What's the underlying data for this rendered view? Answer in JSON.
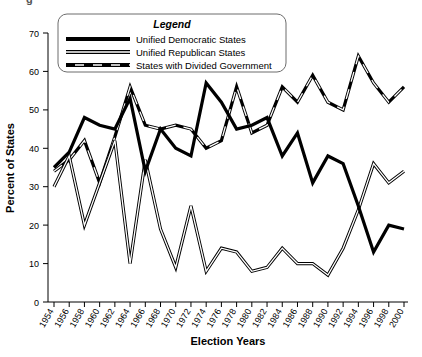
{
  "figure": {
    "caption_stub": "g",
    "xlabel": "Election Years",
    "ylabel": "Percent of States"
  },
  "legend": {
    "title": "Legend",
    "items": [
      {
        "label": "Unified Democratic States",
        "style": "solid-thick",
        "color": "#000000"
      },
      {
        "label": "Unified Republican States",
        "style": "hollow-double",
        "color": "#000000"
      },
      {
        "label": "States with Divided Government",
        "style": "dash-dot-thick",
        "color": "#000000"
      }
    ]
  },
  "axes": {
    "y_ticks": [
      "0",
      "10",
      "20",
      "30",
      "40",
      "50",
      "60",
      "70"
    ],
    "x_ticks": [
      "1954",
      "1956",
      "1958",
      "1960",
      "1962",
      "1964",
      "1966",
      "1968",
      "1970",
      "1972",
      "1974",
      "1976",
      "1978",
      "1980",
      "1982",
      "1984",
      "1986",
      "1988",
      "1990",
      "1992",
      "1994",
      "1996",
      "1998",
      "2000"
    ]
  },
  "chart_data": {
    "type": "line",
    "title": "",
    "xlabel": "Election Years",
    "ylabel": "Percent of States",
    "xlim": [
      1954,
      2000
    ],
    "ylim": [
      0,
      70
    ],
    "grid": false,
    "legend_position": "top-center",
    "x": [
      1954,
      1956,
      1958,
      1960,
      1962,
      1964,
      1966,
      1968,
      1970,
      1972,
      1974,
      1976,
      1978,
      1980,
      1982,
      1984,
      1986,
      1988,
      1990,
      1992,
      1994,
      1996,
      1998,
      2000
    ],
    "series": [
      {
        "name": "Unified Democratic States",
        "style": "solid-thick",
        "values": [
          35,
          39,
          48,
          46,
          45,
          53,
          34,
          45,
          40,
          38,
          57,
          52,
          45,
          46,
          48,
          38,
          44,
          31,
          38,
          36,
          25,
          13,
          20,
          19
        ]
      },
      {
        "name": "Unified Republican States",
        "style": "hollow-double",
        "values": [
          30,
          38,
          20,
          31,
          42,
          10,
          37,
          19,
          9,
          25,
          8,
          14,
          13,
          8,
          9,
          14,
          10,
          10,
          7,
          14,
          24,
          36,
          31,
          34
        ]
      },
      {
        "name": "States with Divided Government",
        "style": "dash-dot-thick",
        "values": [
          34,
          37,
          42,
          31,
          43,
          56,
          46,
          45,
          46,
          45,
          40,
          42,
          56,
          44,
          46,
          56,
          52,
          59,
          52,
          50,
          64,
          57,
          52,
          56
        ]
      }
    ]
  }
}
